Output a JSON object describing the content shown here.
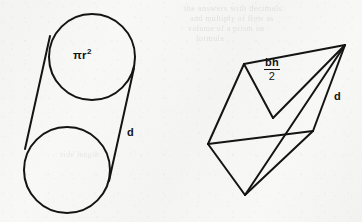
{
  "page": {
    "background_color": "#f6f6f5",
    "ink_color": "#141414"
  },
  "figures": {
    "cylinder": {
      "name": "cylinder",
      "area_label": "πr",
      "area_exponent": "2",
      "depth_label": "d",
      "top_circle": {
        "cx": 92,
        "cy": 57,
        "r": 43
      },
      "bottom_circle": {
        "cx": 67,
        "cy": 170,
        "r": 43
      },
      "tangent_left": {
        "x1": 50,
        "y1": 36,
        "x2": 25,
        "y2": 149
      },
      "tangent_right": {
        "x1": 134,
        "y1": 68,
        "x2": 109,
        "y2": 181
      }
    },
    "prism": {
      "name": "triangular-prism",
      "area_numerator": "bh",
      "area_denominator": "2",
      "depth_label": "d",
      "vertices": {
        "apex_right": {
          "x": 345,
          "y": 45
        },
        "top_left": {
          "x": 244,
          "y": 64
        },
        "left": {
          "x": 208,
          "y": 144
        },
        "bottom": {
          "x": 245,
          "y": 195
        },
        "interior": {
          "x": 273,
          "y": 118
        },
        "right": {
          "x": 313,
          "y": 131
        }
      }
    }
  },
  "bleed_text": {
    "line1": "the answers with  decimals.",
    "line2": "and  multiply  of  flow  as",
    "line3": "volume of  a  prism  on",
    "line4": "formula",
    "line5": "side  length"
  }
}
